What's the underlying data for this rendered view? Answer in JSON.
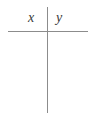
{
  "figure": {
    "type": "cross-axes-diagram",
    "background_color": "#ffffff",
    "line_color": "#8c8c8c",
    "label_color": "#3a3a3a",
    "labels": {
      "left": "x",
      "right": "y"
    },
    "lines": {
      "horizontal": {
        "name": "horizontal-rule",
        "x_start": 8,
        "x_end": 88,
        "y": 31
      },
      "vertical": {
        "name": "vertical-rule",
        "x": 47,
        "y_start": 7,
        "y_end": 113
      }
    }
  }
}
